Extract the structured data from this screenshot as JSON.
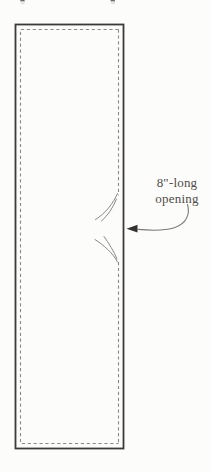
{
  "annotation": {
    "label_line1": "8\"-long",
    "label_line2": "opening"
  },
  "icons": {
    "arrow": "left-pointing-curved-arrow",
    "opening_ticks": "curved-slash-tick-marks"
  },
  "colors": {
    "background": "#fcfcfb",
    "fabric_outline": "#3b3a38",
    "stitch_dash": "#8b8986",
    "tick_stroke": "#8a8885",
    "arrow_shaft": "#7b7977",
    "arrow_head": "#32312f",
    "annotation_text": "#4f4c49"
  }
}
